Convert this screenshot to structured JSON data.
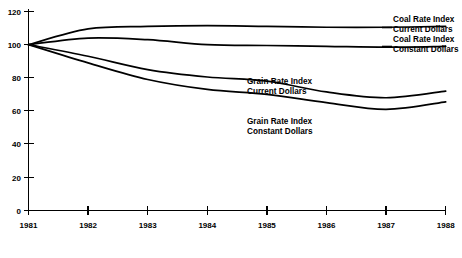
{
  "chart_data": {
    "type": "line",
    "title": "",
    "xlabel": "",
    "ylabel": "",
    "x": [
      1981,
      1982,
      1983,
      1984,
      1985,
      1986,
      1987,
      1988
    ],
    "xtick_labels": [
      "1981",
      "1982",
      "1983",
      "1984",
      "1985",
      "1986",
      "1987",
      "1988"
    ],
    "ytick_labels": [
      "0",
      "20",
      "40",
      "60",
      "80",
      "100",
      "120"
    ],
    "yticks": [
      0,
      20,
      40,
      60,
      80,
      100,
      120
    ],
    "ylim": [
      0,
      120
    ],
    "xlim": [
      1981,
      1988
    ],
    "grid": false,
    "legend_position": "inline-annotations",
    "series": [
      {
        "name": "Coal Rate Index Current Dollars",
        "label_line1": "Coal Rate Index",
        "label_line2": "Current Dollars",
        "values": [
          100,
          109.5,
          111,
          111.5,
          111,
          110.5,
          110.5,
          111
        ]
      },
      {
        "name": "Coal Rate Index Constant Dollars",
        "label_line1": "Coal Rate Index",
        "label_line2": "Constant Dollars",
        "values": [
          100,
          104,
          103,
          100,
          99.5,
          99,
          98.5,
          99
        ]
      },
      {
        "name": "Grain Rate Index Current Dollars",
        "label_line1": "Grain Rate Index",
        "label_line2": "Current Dollars",
        "values": [
          100,
          93,
          85,
          80.5,
          78,
          71.5,
          68,
          72
        ]
      },
      {
        "name": "Grain Rate Index Constant Dollars",
        "label_line1": "Grain Rate Index",
        "label_line2": "Constant Dollars",
        "values": [
          100,
          89,
          79,
          73,
          70,
          65,
          61,
          65.5
        ]
      }
    ]
  }
}
